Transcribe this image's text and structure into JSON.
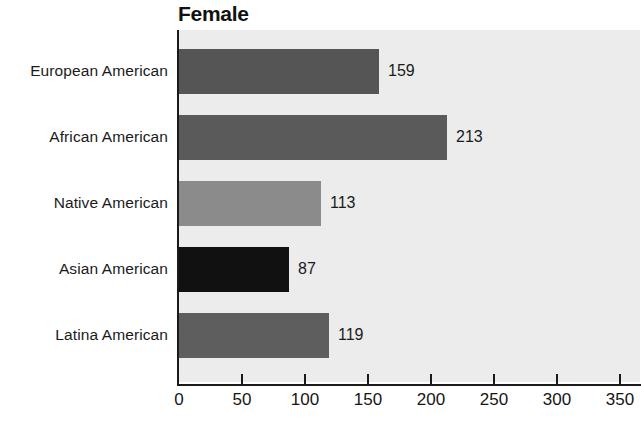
{
  "chart_data": {
    "type": "bar",
    "orientation": "horizontal",
    "title": "Female",
    "xlabel": "",
    "ylabel": "",
    "categories": [
      "European American",
      "African American",
      "Native American",
      "Asian American",
      "Latina American"
    ],
    "values": [
      159,
      213,
      113,
      87,
      119
    ],
    "value_labels": [
      "159",
      "213",
      "113",
      "87",
      "119"
    ],
    "bar_colors": [
      "#555555",
      "#5a5a5a",
      "#8b8b8b",
      "#111111",
      "#5e5e5e"
    ],
    "xlim": [
      0,
      350
    ],
    "xticks": [
      0,
      50,
      100,
      150,
      200,
      250,
      300,
      350
    ],
    "xtick_labels": [
      "0",
      "50",
      "100",
      "150",
      "200",
      "250",
      "300",
      "350"
    ],
    "grid": false,
    "legend": null,
    "plot_background": "#ececec",
    "axis_color": "#1a1a1a",
    "text_color": "#1b1b1b"
  }
}
